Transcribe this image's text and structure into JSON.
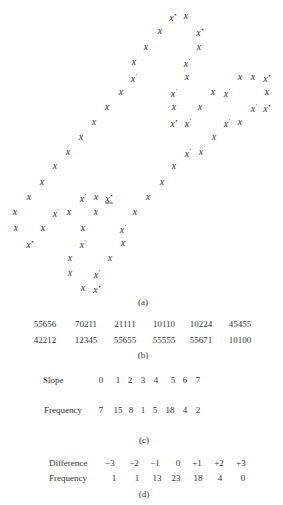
{
  "figure_a": {
    "caption": "(a)",
    "marks": [
      {
        "x": 173,
        "y": 16,
        "t": "x",
        "s": "*"
      },
      {
        "x": 186,
        "y": 16,
        "t": "x",
        "s": ""
      },
      {
        "x": 160,
        "y": 31,
        "t": "x",
        "s": ""
      },
      {
        "x": 200,
        "y": 31,
        "t": "x",
        "s": "*"
      },
      {
        "x": 146,
        "y": 47,
        "t": "x",
        "s": ""
      },
      {
        "x": 199,
        "y": 47,
        "t": "x",
        "s": ""
      },
      {
        "x": 134,
        "y": 62,
        "t": "x",
        "s": ""
      },
      {
        "x": 187,
        "y": 62,
        "t": "x",
        "s": "′"
      },
      {
        "x": 134,
        "y": 77,
        "t": "x",
        "s": "′"
      },
      {
        "x": 187,
        "y": 77,
        "t": "x",
        "s": ""
      },
      {
        "x": 240,
        "y": 77,
        "t": "x",
        "s": ""
      },
      {
        "x": 253,
        "y": 77,
        "t": "x",
        "s": ""
      },
      {
        "x": 267,
        "y": 77,
        "t": "x",
        "s": "*"
      },
      {
        "x": 121,
        "y": 92,
        "t": "x",
        "s": ""
      },
      {
        "x": 174,
        "y": 92,
        "t": "x",
        "s": "′"
      },
      {
        "x": 213,
        "y": 92,
        "t": "x",
        "s": ""
      },
      {
        "x": 227,
        "y": 92,
        "t": "x",
        "s": "′"
      },
      {
        "x": 267,
        "y": 92,
        "t": "x",
        "s": ""
      },
      {
        "x": 107,
        "y": 107,
        "t": "x",
        "s": ""
      },
      {
        "x": 174,
        "y": 107,
        "t": "x",
        "s": ""
      },
      {
        "x": 200,
        "y": 107,
        "t": "x",
        "s": ""
      },
      {
        "x": 254,
        "y": 107,
        "t": "x",
        "s": "′"
      },
      {
        "x": 267,
        "y": 107,
        "t": "x",
        "s": "*"
      },
      {
        "x": 94,
        "y": 122,
        "t": "x",
        "s": ""
      },
      {
        "x": 174,
        "y": 122,
        "t": "x",
        "s": "*"
      },
      {
        "x": 188,
        "y": 122,
        "t": "x",
        "s": "′"
      },
      {
        "x": 227,
        "y": 122,
        "t": "x",
        "s": "′"
      },
      {
        "x": 240,
        "y": 122,
        "t": "x",
        "s": ""
      },
      {
        "x": 81,
        "y": 137,
        "t": "x",
        "s": ""
      },
      {
        "x": 214,
        "y": 137,
        "t": "x",
        "s": ""
      },
      {
        "x": 68,
        "y": 152,
        "t": "x",
        "s": ""
      },
      {
        "x": 188,
        "y": 152,
        "t": "x",
        "s": "′"
      },
      {
        "x": 201,
        "y": 152,
        "t": "x",
        "s": ""
      },
      {
        "x": 55,
        "y": 166,
        "t": "x",
        "s": ""
      },
      {
        "x": 174,
        "y": 166,
        "t": "x",
        "s": ""
      },
      {
        "x": 42,
        "y": 182,
        "t": "x",
        "s": ""
      },
      {
        "x": 162,
        "y": 182,
        "t": "x",
        "s": ""
      },
      {
        "x": 29,
        "y": 197,
        "t": "x",
        "s": ""
      },
      {
        "x": 83,
        "y": 197,
        "t": "x",
        "s": "′"
      },
      {
        "x": 96,
        "y": 197,
        "t": "x",
        "s": ""
      },
      {
        "x": 109,
        "y": 197,
        "t": "x",
        "s": "*",
        "u": true
      },
      {
        "x": 148,
        "y": 197,
        "t": "x",
        "s": ""
      },
      {
        "x": 15,
        "y": 212,
        "t": "x",
        "s": ""
      },
      {
        "x": 56,
        "y": 212,
        "t": "x",
        "s": "′"
      },
      {
        "x": 69,
        "y": 212,
        "t": "x",
        "s": ""
      },
      {
        "x": 96,
        "y": 212,
        "t": "x",
        "s": ""
      },
      {
        "x": 135,
        "y": 212,
        "t": "x",
        "s": ""
      },
      {
        "x": 16,
        "y": 228,
        "t": "x",
        "s": ""
      },
      {
        "x": 43,
        "y": 228,
        "t": "x",
        "s": ""
      },
      {
        "x": 83,
        "y": 228,
        "t": "x",
        "s": ""
      },
      {
        "x": 123,
        "y": 228,
        "t": "x",
        "s": "′"
      },
      {
        "x": 30,
        "y": 243,
        "t": "x",
        "s": "*"
      },
      {
        "x": 83,
        "y": 243,
        "t": "x",
        "s": "′"
      },
      {
        "x": 123,
        "y": 243,
        "t": "x",
        "s": ""
      },
      {
        "x": 70,
        "y": 258,
        "t": "x",
        "s": ""
      },
      {
        "x": 110,
        "y": 258,
        "t": "x",
        "s": ""
      },
      {
        "x": 70,
        "y": 273,
        "t": "x",
        "s": ""
      },
      {
        "x": 97,
        "y": 273,
        "t": "x",
        "s": "′"
      },
      {
        "x": 83,
        "y": 288,
        "t": "x",
        "s": ""
      },
      {
        "x": 97,
        "y": 288,
        "t": "x",
        "s": "*"
      }
    ]
  },
  "figure_b": {
    "caption": "(b)",
    "rows": [
      [
        "55656",
        "70211",
        "21111",
        "10110",
        "10224",
        "45455"
      ],
      [
        "42212",
        "12345",
        "55655",
        "55555",
        "55671",
        "10100"
      ]
    ]
  },
  "figure_c": {
    "caption": "(c)",
    "row1_label": "Slope",
    "row1_values": [
      "0",
      "1",
      "2",
      "3",
      "4",
      "5",
      "6",
      "7"
    ],
    "row2_label": "Frequency",
    "row2_values": [
      "7",
      "15",
      "8",
      "1",
      "5",
      "18",
      "4",
      "2"
    ]
  },
  "figure_d": {
    "caption": "(d)",
    "row1_label": "Difference",
    "row1_values": [
      "−3",
      "−2",
      "−1",
      "0",
      "+1",
      "+2",
      "+3"
    ],
    "row2_label": "Frequency",
    "row2_values": [
      "1",
      "1",
      "13",
      "23",
      "18",
      "4",
      "0"
    ]
  },
  "chart_data": [
    {
      "type": "table",
      "title": "(c) Slope frequency",
      "categories": [
        "0",
        "1",
        "2",
        "3",
        "4",
        "5",
        "6",
        "7"
      ],
      "series": [
        {
          "name": "Frequency",
          "values": [
            7,
            15,
            8,
            1,
            5,
            18,
            4,
            2
          ]
        }
      ],
      "xlabel": "Slope",
      "ylabel": "Frequency"
    },
    {
      "type": "table",
      "title": "(d) Difference frequency",
      "categories": [
        "-3",
        "-2",
        "-1",
        "0",
        "+1",
        "+2",
        "+3"
      ],
      "series": [
        {
          "name": "Frequency",
          "values": [
            1,
            1,
            13,
            23,
            18,
            4,
            0
          ]
        }
      ],
      "xlabel": "Difference",
      "ylabel": "Frequency"
    }
  ]
}
